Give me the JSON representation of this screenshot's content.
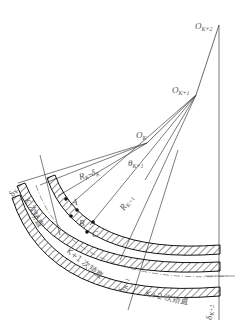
{
  "diagram": {
    "type": "technical-drawing",
    "centers": [
      {
        "id": "ok",
        "base": "O",
        "sub": "K"
      },
      {
        "id": "ok1",
        "base": "O",
        "sub": "K+1"
      },
      {
        "id": "ok2",
        "base": "O",
        "sub": "K+2"
      }
    ],
    "angles": [
      {
        "id": "theta_k",
        "base": "θ",
        "sub": "K"
      },
      {
        "id": "theta_k1",
        "base": "θ",
        "sub": "K+1"
      }
    ],
    "radii": [
      {
        "id": "rk_delta",
        "text": "R",
        "sub": "K",
        "suffix": "-δ",
        "suffix_sub": "K"
      },
      {
        "id": "rk1",
        "text": "R",
        "sub": "K+1"
      }
    ],
    "points": [
      "A",
      "B",
      "C"
    ],
    "thickness_labels": [
      {
        "id": "delta_k",
        "base": "δ",
        "sub": "K"
      },
      {
        "id": "delta_k1",
        "base": "δ",
        "sub": "K+1"
      },
      {
        "id": "delta_k2",
        "base": "δ",
        "sub": "K+2"
      }
    ],
    "stage_labels": [
      {
        "id": "stage_k",
        "text": "K 次矫直"
      },
      {
        "id": "stage_k1",
        "text": "K+1 次矫直"
      },
      {
        "id": "stage_k2",
        "text": "K+2 次矫直"
      }
    ]
  }
}
